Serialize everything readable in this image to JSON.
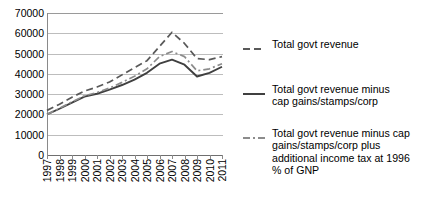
{
  "chart_data": {
    "type": "line",
    "title": "",
    "xlabel": "",
    "ylabel": "",
    "x": [
      1997,
      1998,
      1999,
      2000,
      2001,
      2002,
      2003,
      2004,
      2005,
      2006,
      2007,
      2008,
      2009,
      2010,
      2011
    ],
    "categories": [
      "1997",
      "1998",
      "1999",
      "2000",
      "2001",
      "2002",
      "2003",
      "2004",
      "2005",
      "2006",
      "2007",
      "2008",
      "2009",
      "2010",
      "2011"
    ],
    "ylim": [
      0,
      70000
    ],
    "yticks": [
      0,
      10000,
      20000,
      30000,
      40000,
      50000,
      60000,
      70000
    ],
    "ytick_labels": [
      "0",
      "10000",
      "20000",
      "30000",
      "40000",
      "50000",
      "60000",
      "70000"
    ],
    "grid": true,
    "legend_position": "right",
    "series": [
      {
        "name": "Total govt revenue",
        "style": "dashed",
        "color": "#595959",
        "values": [
          22000,
          25000,
          28500,
          31500,
          33500,
          36000,
          39500,
          43000,
          46500,
          53500,
          60500,
          55000,
          47500,
          47000,
          48500
        ]
      },
      {
        "name": "Total govt revenue minus cap gains/stamps/corp",
        "style": "solid",
        "color": "#404040",
        "values": [
          20000,
          22800,
          25800,
          28800,
          30200,
          32200,
          34500,
          37200,
          40500,
          45000,
          47000,
          44500,
          38700,
          40500,
          43500
        ]
      },
      {
        "name": "Total govt revenue minus cap gains/stamps/corp plus additional income tax at 1996 % of GNP",
        "style": "dashdot",
        "color": "#8c8c8c",
        "values": [
          20000,
          23000,
          26200,
          29200,
          30800,
          33000,
          35800,
          38800,
          42500,
          48500,
          51000,
          48500,
          41500,
          42500,
          45000
        ]
      }
    ]
  },
  "legend": {
    "items": [
      {
        "label": "Total govt revenue",
        "sample_name": "legend-sample-dashed"
      },
      {
        "label": "Total govt revenue minus\ncap gains/stamps/corp",
        "sample_name": "legend-sample-solid"
      },
      {
        "label": "Total govt revenue minus cap\ngains/stamps/corp plus\nadditional income tax at 1996\n% of GNP",
        "sample_name": "legend-sample-dashdot"
      }
    ]
  }
}
